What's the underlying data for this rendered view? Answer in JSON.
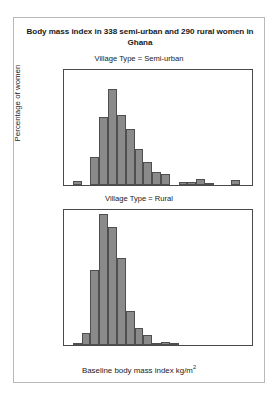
{
  "figure": {
    "title": "Body mass index in 338 semi-urban and 290 rural women in Ghana",
    "ylabel": "Percentage of women",
    "xlabel_main": "Baseline body mass index kg/m",
    "xlabel_exponent": "2",
    "bar_color": "#8a8a8a",
    "bar_edge_color": "#4f4f4f",
    "axis_color": "#4a4a4a",
    "frame_color": "#b9b9b9"
  },
  "chart_data": {
    "type": "bar",
    "title": "Body mass index in 338 semi-urban and 290 rural women in Ghana",
    "xlabel": "Baseline body mass index kg/m2",
    "ylabel": "Percentage of women",
    "xlim": [
      9.5,
      41.5
    ],
    "ylim": [
      0,
      27.5
    ],
    "xticks": [
      10,
      20,
      30,
      40
    ],
    "yticks": [
      0,
      5,
      10,
      15,
      20,
      25
    ],
    "grid": false,
    "legend": false,
    "bin_width": 1.5,
    "panels": [
      {
        "label": "Village Type = Semi-urban",
        "n": 338,
        "bin_starts": [
          11.0,
          12.5,
          14.0,
          15.5,
          17.0,
          18.5,
          20.0,
          21.5,
          23.0,
          24.5,
          26.0,
          27.5,
          29.0,
          30.5,
          32.0,
          33.5,
          38.0,
          39.5
        ],
        "values": [
          0.9,
          0.0,
          6.6,
          16.3,
          22.9,
          16.8,
          13.4,
          8.7,
          5.4,
          3.0,
          2.7,
          0.0,
          0.7,
          0.7,
          1.4,
          0.2,
          1.2,
          0.0
        ]
      },
      {
        "label": "Village Type = Rural",
        "n": 290,
        "bin_starts": [
          11.0,
          12.5,
          14.0,
          15.5,
          17.0,
          18.5,
          20.0,
          21.5,
          23.0,
          24.5,
          26.0,
          27.5,
          29.0,
          30.5,
          32.0,
          33.5
        ],
        "values": [
          0.3,
          2.4,
          15.3,
          26.7,
          24.1,
          17.7,
          6.9,
          3.5,
          2.0,
          0.4,
          0.7,
          0.3,
          0.0,
          0.0,
          0.0,
          0.0
        ]
      }
    ]
  }
}
